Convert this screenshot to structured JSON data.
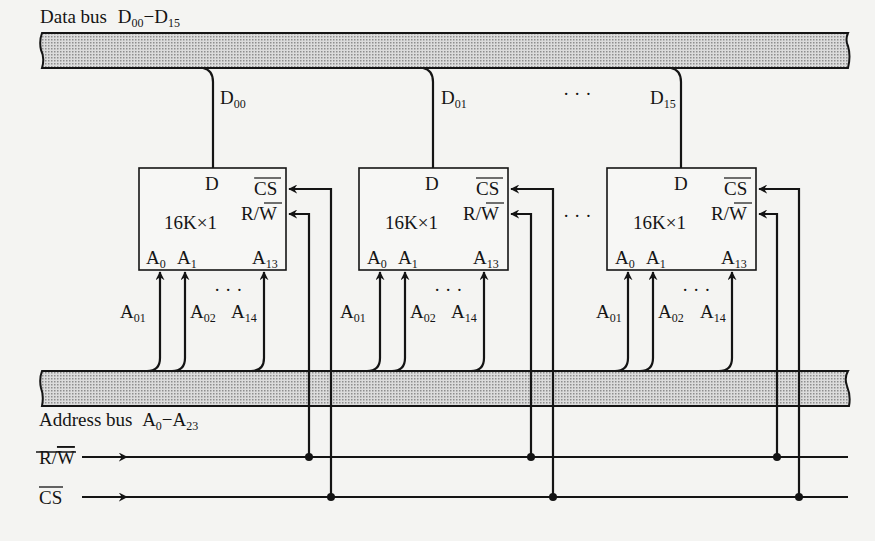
{
  "diagram": {
    "data_bus": {
      "label": "Data bus",
      "range_start": "D",
      "range_start_sub": "00",
      "dash": "−",
      "range_end": "D",
      "range_end_sub": "15"
    },
    "address_bus": {
      "label": "Address bus",
      "range_start": "A",
      "range_start_sub": "0",
      "dash": "−",
      "range_end": "A",
      "range_end_sub": "23"
    },
    "control_lines": {
      "rw": {
        "main": "R/",
        "bar": "W"
      },
      "cs": {
        "bar": "CS"
      }
    },
    "chips": [
      {
        "size_label": "16K×1",
        "data_pin": "D",
        "cs_pin": "CS",
        "rw_pin_main": "R/",
        "rw_pin_bar": "W",
        "addr_pins": [
          {
            "m": "A",
            "s": "0"
          },
          {
            "m": "A",
            "s": "1"
          },
          {
            "m": "A",
            "s": "13"
          }
        ],
        "data_line": {
          "m": "D",
          "s": "00"
        },
        "addr_lines": [
          {
            "m": "A",
            "s": "01"
          },
          {
            "m": "A",
            "s": "02"
          },
          {
            "m": "A",
            "s": "14"
          }
        ]
      },
      {
        "size_label": "16K×1",
        "data_pin": "D",
        "cs_pin": "CS",
        "rw_pin_main": "R/",
        "rw_pin_bar": "W",
        "addr_pins": [
          {
            "m": "A",
            "s": "0"
          },
          {
            "m": "A",
            "s": "1"
          },
          {
            "m": "A",
            "s": "13"
          }
        ],
        "data_line": {
          "m": "D",
          "s": "01"
        },
        "addr_lines": [
          {
            "m": "A",
            "s": "01"
          },
          {
            "m": "A",
            "s": "02"
          },
          {
            "m": "A",
            "s": "14"
          }
        ]
      },
      {
        "size_label": "16K×1",
        "data_pin": "D",
        "cs_pin": "CS",
        "rw_pin_main": "R/",
        "rw_pin_bar": "W",
        "addr_pins": [
          {
            "m": "A",
            "s": "0"
          },
          {
            "m": "A",
            "s": "1"
          },
          {
            "m": "A",
            "s": "13"
          }
        ],
        "data_line": {
          "m": "D",
          "s": "15"
        },
        "addr_lines": [
          {
            "m": "A",
            "s": "01"
          },
          {
            "m": "A",
            "s": "02"
          },
          {
            "m": "A",
            "s": "14"
          }
        ]
      }
    ],
    "ellipsis": "· · ·",
    "colors": {
      "ink": "#141414",
      "paper": "#f4f4f2",
      "bus_fill": "#c9c9c9"
    }
  }
}
